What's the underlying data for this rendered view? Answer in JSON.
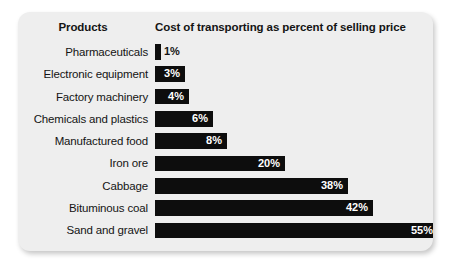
{
  "card": {
    "background_color": "#eeeeee",
    "bar_color": "#0d0d0d",
    "text_color": "#141414",
    "inside_label_color": "#ffffff"
  },
  "header": {
    "products_label": "Products",
    "measure_label": "Cost of transporting as percent of selling price"
  },
  "chart_data": {
    "type": "bar",
    "orientation": "horizontal",
    "title": "",
    "subtitle": "",
    "xlabel": "Cost of transporting as percent of selling price",
    "ylabel": "Products",
    "grid": false,
    "legend": false,
    "xlim": [
      0,
      55
    ],
    "value_suffix": "%",
    "categories": [
      "Pharmaceuticals",
      "Electronic equipment",
      "Factory machinery",
      "Chemicals and plastics",
      "Manufactured food",
      "Iron ore",
      "Cabbage",
      "Bituminous coal",
      "Sand and gravel"
    ],
    "values": [
      1,
      3,
      4,
      6,
      8,
      20,
      38,
      42,
      55
    ],
    "value_labels": [
      "1%",
      "3%",
      "4%",
      "6%",
      "8%",
      "20%",
      "38%",
      "42%",
      "55%"
    ],
    "bar_pixel_widths": [
      6,
      30,
      34,
      58,
      72,
      130,
      193,
      218,
      283
    ],
    "label_placement": [
      "outside",
      "inside",
      "inside",
      "inside",
      "inside",
      "inside",
      "inside",
      "inside",
      "inside"
    ]
  }
}
